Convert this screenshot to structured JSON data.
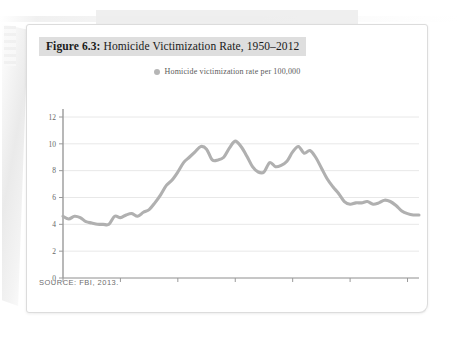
{
  "figure": {
    "label": "Figure 6.3:",
    "title": " Homicide Victimization Rate, 1950–2012",
    "source": "SOURCE: FBI, 2013."
  },
  "legend": {
    "marker": "series-dot-icon",
    "label": "Homicide victimization rate per 100,000"
  },
  "colors": {
    "line": "#b0b0b0",
    "axis": "#9a9a9a",
    "grid": "#e8e8e8",
    "tick_text": "#666666",
    "title_highlight": "#dedede",
    "card": "#ffffff"
  },
  "chart_data": {
    "type": "line",
    "title": "Figure 6.3: Homicide Victimization Rate, 1950–2012",
    "xlabel": "",
    "ylabel": "",
    "xlim": [
      1950,
      2012
    ],
    "ylim": [
      0,
      12
    ],
    "grid": true,
    "legend_position": "top-center",
    "yticks": [
      0,
      2,
      4,
      6,
      8,
      10,
      12
    ],
    "ytick_labels": [
      "0",
      "2",
      "4",
      "6",
      "8",
      "10",
      "12"
    ],
    "xticks": [
      1950,
      1960,
      1970,
      1980,
      1990,
      2000,
      2010
    ],
    "xtick_labels": [
      "1950",
      "1960",
      "1970",
      "1980",
      "1990",
      "2000",
      "2010"
    ],
    "series": [
      {
        "name": "Homicide victimization rate per 100,000",
        "color": "#b0b0b0",
        "x": [
          1950,
          1951,
          1952,
          1953,
          1954,
          1955,
          1956,
          1957,
          1958,
          1959,
          1960,
          1961,
          1962,
          1963,
          1964,
          1965,
          1966,
          1967,
          1968,
          1969,
          1970,
          1971,
          1972,
          1973,
          1974,
          1975,
          1976,
          1977,
          1978,
          1979,
          1980,
          1981,
          1982,
          1983,
          1984,
          1985,
          1986,
          1987,
          1988,
          1989,
          1990,
          1991,
          1992,
          1993,
          1994,
          1995,
          1996,
          1997,
          1998,
          1999,
          2000,
          2001,
          2002,
          2003,
          2004,
          2005,
          2006,
          2007,
          2008,
          2009,
          2010,
          2011,
          2012
        ],
        "values": [
          4.6,
          4.4,
          4.6,
          4.5,
          4.2,
          4.1,
          4.0,
          4.0,
          4.0,
          4.6,
          4.5,
          4.7,
          4.8,
          4.6,
          4.9,
          5.1,
          5.6,
          6.2,
          6.9,
          7.3,
          7.9,
          8.6,
          9.0,
          9.4,
          9.8,
          9.6,
          8.8,
          8.8,
          9.0,
          9.7,
          10.2,
          9.8,
          9.1,
          8.3,
          7.9,
          7.9,
          8.6,
          8.3,
          8.4,
          8.7,
          9.4,
          9.8,
          9.3,
          9.5,
          9.0,
          8.2,
          7.4,
          6.8,
          6.3,
          5.7,
          5.5,
          5.6,
          5.6,
          5.7,
          5.5,
          5.6,
          5.8,
          5.7,
          5.4,
          5.0,
          4.8,
          4.7,
          4.7
        ]
      }
    ]
  }
}
